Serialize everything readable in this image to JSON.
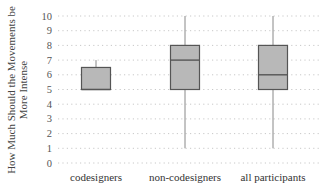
{
  "chart_data": {
    "type": "box",
    "title": "",
    "xlabel": "",
    "ylabel": "How Much Should the Movements be More Intense",
    "ylabel_lines": [
      "How Much Should the Movements be",
      "More Intense"
    ],
    "ylim": [
      0,
      10
    ],
    "yticks": [
      0,
      1,
      2,
      3,
      4,
      5,
      6,
      7,
      8,
      9,
      10
    ],
    "grid": "dotted horizontal",
    "legend": "none",
    "categories": [
      "codesigners",
      "non-codesigners",
      "all participants"
    ],
    "series": [
      {
        "name": "codesigners",
        "whisker_low": 5,
        "q1": 5,
        "median": 5,
        "q3": 6.5,
        "whisker_high": 7
      },
      {
        "name": "non-codesigners",
        "whisker_low": 1,
        "q1": 5,
        "median": 7,
        "q3": 8,
        "whisker_high": 10
      },
      {
        "name": "all participants",
        "whisker_low": 1,
        "q1": 5,
        "median": 6,
        "q3": 8,
        "whisker_high": 10
      }
    ],
    "colors": {
      "box_fill": "#b8b8b8",
      "box_stroke": "#555555",
      "whisker": "#888888",
      "grid": "#c8c8c8"
    }
  }
}
